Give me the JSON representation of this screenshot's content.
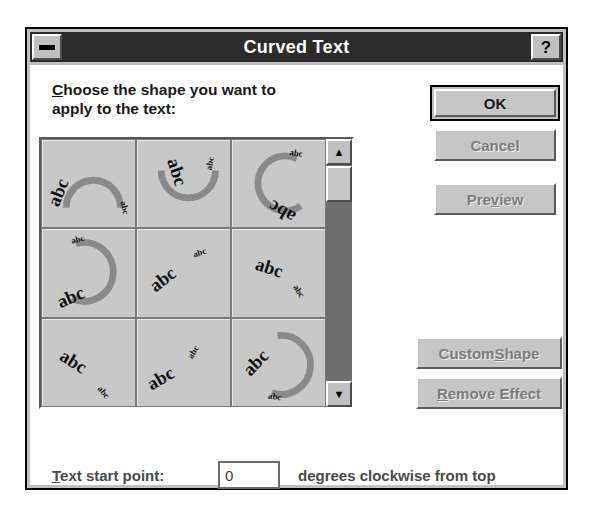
{
  "window": {
    "title": "Curved Text",
    "minimize_icon": "minimize-icon",
    "help_label": "?"
  },
  "prompt": {
    "accelerator": "C",
    "line1_rest": "hoose the shape you want to",
    "line2": "apply to the text:"
  },
  "shape_grid": {
    "sample_text": "abc",
    "selected_index": null,
    "cells": [
      {
        "index": 1,
        "name": "arch-up-shape",
        "label": "abc"
      },
      {
        "index": 2,
        "name": "arch-down-shape",
        "label": "abc"
      },
      {
        "index": 3,
        "name": "circle-open-right-shape",
        "label": "abc"
      },
      {
        "index": 4,
        "name": "circle-open-left-shape",
        "label": "abc"
      },
      {
        "index": 5,
        "name": "slant-up-shape",
        "label": "abc"
      },
      {
        "index": 6,
        "name": "slant-down-shape",
        "label": "abc"
      },
      {
        "index": 7,
        "name": "curve-down-right-shape",
        "label": "abc"
      },
      {
        "index": 8,
        "name": "curve-up-right-shape",
        "label": "abc"
      },
      {
        "index": 9,
        "name": "full-circle-shape",
        "label": "abc"
      }
    ]
  },
  "scrollbar": {
    "up_arrow": "▲",
    "down_arrow": "▼",
    "position": "top"
  },
  "buttons": {
    "ok": {
      "label": "OK",
      "enabled": true,
      "default": true
    },
    "cancel": {
      "label": "Cancel",
      "enabled": false
    },
    "preview_pre": "Pre",
    "preview_acc": "v",
    "preview_post": "iew",
    "custom_shape_pre": "Custom ",
    "custom_shape_acc": "S",
    "custom_shape_post": "hape",
    "remove_effect_acc": "R",
    "remove_effect_post": "emove Effect"
  },
  "start_point": {
    "label_acc": "T",
    "label_rest": "ext start point:",
    "value": "0",
    "placeholder": "0",
    "suffix": "degrees clockwise from top"
  },
  "colors": {
    "face": "#c0c0c0",
    "titlebar": "#2b2b2b",
    "title_text": "#ffffff",
    "disabled_text": "#7d7d7d",
    "arc": "#8a8a8a",
    "scroll_track": "#6e6e6e"
  }
}
